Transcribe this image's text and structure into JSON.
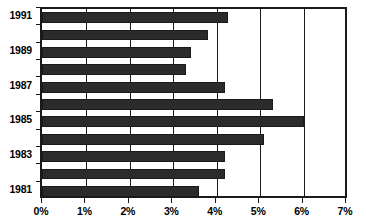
{
  "chart_data": {
    "type": "bar",
    "orientation": "horizontal",
    "title": "",
    "xlabel": "",
    "ylabel": "",
    "categories": [
      "1981",
      "1982",
      "1983",
      "1984",
      "1985",
      "1986",
      "1987",
      "1988",
      "1989",
      "1990",
      "1991"
    ],
    "values": [
      3.6,
      4.2,
      4.2,
      5.1,
      6.0,
      5.3,
      4.2,
      3.3,
      3.4,
      3.8,
      4.25
    ],
    "xlim": [
      0,
      7
    ],
    "xtick_values": [
      0,
      1,
      2,
      3,
      4,
      5,
      6,
      7
    ],
    "xtick_labels": [
      "0%",
      "1%",
      "2%",
      "3%",
      "4%",
      "5%",
      "6%",
      "7%"
    ],
    "ytick_labels": [
      "1991",
      "1989",
      "1987",
      "1985",
      "1983",
      "1981"
    ],
    "ytick_categories": [
      "1991",
      "1989",
      "1987",
      "1985",
      "1983",
      "1981"
    ],
    "grid": true,
    "grid_axis": "x",
    "legend": null,
    "bar_color": "#2b2b2b",
    "axis_color": "#1a1a1a",
    "background_color": "#ffffff"
  }
}
